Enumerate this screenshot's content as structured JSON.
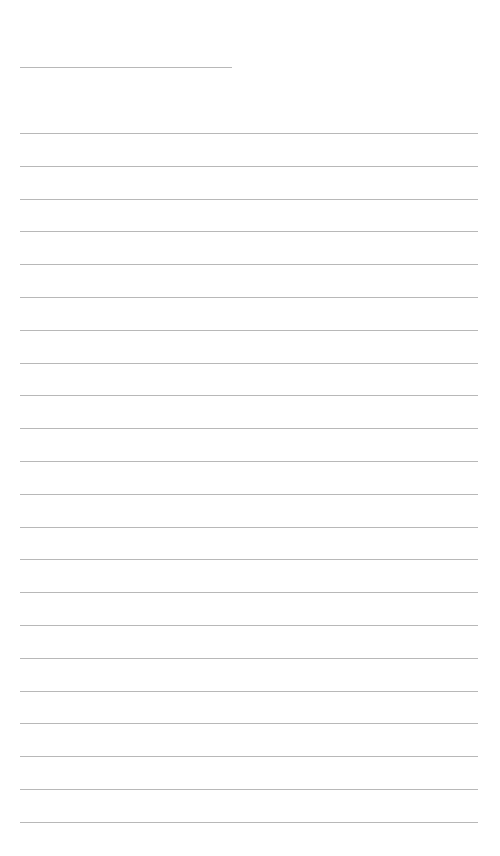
{
  "page": {
    "type": "blank lined writing sheet",
    "background_color": "#ffffff",
    "line_color": "#b8b8b8",
    "title_line": {
      "x": 20,
      "y": 67,
      "width": 212
    },
    "ruled_lines": {
      "count": 22,
      "x": 20,
      "width": 458,
      "first_y": 133,
      "spacing": 32.8
    }
  }
}
